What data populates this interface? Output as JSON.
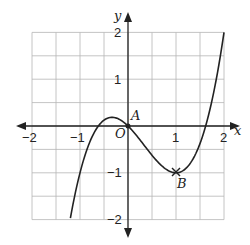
{
  "chart_data": {
    "type": "line",
    "title": "",
    "xlabel": "x",
    "ylabel": "y",
    "xlim": [
      -2,
      2
    ],
    "ylim": [
      -2,
      2
    ],
    "grid": true,
    "grid_step": 0.5,
    "x_ticks": [
      "-2",
      "-1",
      "1",
      "2"
    ],
    "y_ticks": [
      "2",
      "1",
      "-1",
      "-2"
    ],
    "origin_label": "O",
    "series": [
      {
        "name": "curve",
        "equation": "y = x^3 - x^2 - x",
        "x": [
          -1.2,
          -1.0,
          -0.8,
          -0.618,
          -0.4,
          -0.333,
          -0.2,
          0,
          0.2,
          0.4,
          0.6,
          0.8,
          1.0,
          1.2,
          1.4,
          1.618,
          1.8,
          2.0
        ],
        "y": [
          -1.97,
          -1.0,
          -0.35,
          0.0,
          0.18,
          0.185,
          0.15,
          0.0,
          -0.23,
          -0.5,
          -0.74,
          -0.93,
          -1.0,
          -0.91,
          -0.62,
          0.0,
          0.79,
          2.0
        ]
      }
    ],
    "points": [
      {
        "label": "A",
        "x": 0,
        "y": 0
      },
      {
        "label": "B",
        "x": 1,
        "y": -1
      }
    ]
  },
  "labels": {
    "x_axis": "x",
    "y_axis": "y",
    "origin": "O",
    "point_a": "A",
    "point_b": "B",
    "tick_x_m2": "−2",
    "tick_x_m1": "−1",
    "tick_x_1": "1",
    "tick_x_2": "2",
    "tick_y_2": "2",
    "tick_y_1": "1",
    "tick_y_m1": "−1",
    "tick_y_m2": "−2"
  }
}
